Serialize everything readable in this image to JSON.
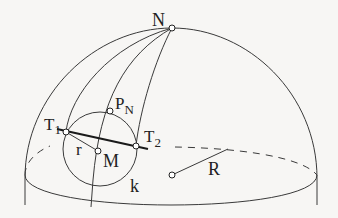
{
  "figure": {
    "labels": {
      "N": "N",
      "P": "P",
      "P_sub": "N",
      "T1": "T",
      "T1_sub": "1",
      "T2": "T",
      "T2_sub": "2",
      "r": "r",
      "M": "M",
      "k": "k",
      "R": "R"
    },
    "points": {
      "N": [
        172,
        28
      ],
      "P_N": [
        110,
        111
      ],
      "T1": [
        66,
        132
      ],
      "T2": [
        136,
        146
      ],
      "M": [
        98,
        151
      ],
      "O": [
        172,
        175
      ]
    },
    "colors": {
      "background": "#f7f6f4",
      "stroke": "#3a3a3a",
      "thick_stroke": "#1a1a1a"
    }
  }
}
